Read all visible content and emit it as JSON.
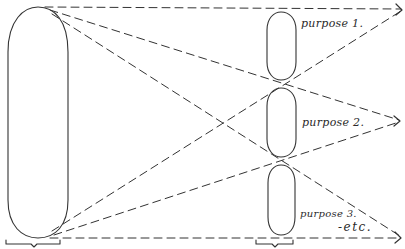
{
  "diagram": {
    "colors": {
      "ink": "#333333",
      "background": "#ffffff"
    },
    "source_shape": {
      "shape": "tall-rounded-capsule",
      "has_bracket_below": true
    },
    "target_shapes": [
      {
        "shape": "small-rounded-capsule",
        "label": "purpose 1."
      },
      {
        "shape": "small-rounded-capsule",
        "label": "purpose 2."
      },
      {
        "shape": "small-rounded-capsule",
        "label": "purpose 3."
      }
    ],
    "trailing_label": "-etc.",
    "targets_bracket_below": true,
    "connector_style": "dashed-arrow"
  }
}
